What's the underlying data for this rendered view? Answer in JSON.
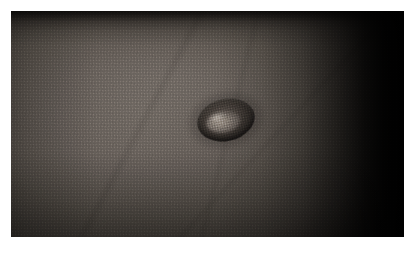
{
  "canvas": {
    "width": 414,
    "height": 254,
    "background_color": "#ffffff"
  },
  "figure": {
    "type": "clinical-photograph",
    "caption": "",
    "alt_text": "Close-up clinical photograph of dark skin showing a solitary raised oval nodule with a hyperpigmented rim and a lighter, shiny central surface.",
    "plate": {
      "left": 11,
      "top": 11,
      "width": 393,
      "height": 226,
      "border_color": "#ffffff"
    }
  },
  "subject": {
    "modality": "Color photograph",
    "region": "Skin",
    "skin_tone": "Dark brown",
    "base_color": "#635c57",
    "shadow_color": "#1d1a19",
    "highlight_color": "#6d6660"
  },
  "lesion": {
    "label": "",
    "shape": "oval",
    "position": {
      "x": 197,
      "y": 99,
      "width": 58,
      "height": 42
    },
    "rotation_deg": -13,
    "rim_color": "#2a2522",
    "core_color": "#8c837a",
    "specular_color": "#cec6bd",
    "description": "Solitary raised nodule with rolled darker border and a pale glistening centre"
  },
  "lighting": {
    "highlight_origin": "upper-left",
    "vignette": "strong right-edge falloff to black",
    "top_band_color": "#080706"
  }
}
